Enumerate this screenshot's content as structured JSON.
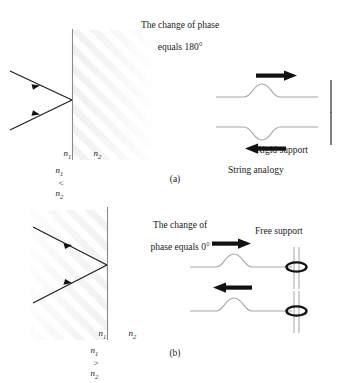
{
  "figure": {
    "panels": [
      {
        "id": "a",
        "letter": "(a)",
        "title_line1": "The change of phase",
        "title_line2": "equals 180°",
        "medium_left": "n",
        "medium_left_sub": "1",
        "medium_right": "n",
        "medium_right_sub": "2",
        "relation_left": "n",
        "relation_left_sub": "1",
        "relation_op": "<",
        "relation_right": "n",
        "relation_right_sub": "2",
        "support_label": "Rigid support",
        "analogy_label": "String analogy",
        "incident_arrow_direction": "right",
        "reflected_arrow_direction": "left",
        "pulse_incident": "up",
        "pulse_reflected": "down",
        "shading_side": "right"
      },
      {
        "id": "b",
        "letter": "(b)",
        "title_line1": "The change of",
        "title_line2": "phase equals 0°",
        "medium_left": "n",
        "medium_left_sub": "1",
        "medium_right": "n",
        "medium_right_sub": "2",
        "relation_left": "n",
        "relation_left_sub": "1",
        "relation_op": ">",
        "relation_right": "n",
        "relation_right_sub": "2",
        "support_label": "Free support",
        "incident_arrow_direction": "right",
        "reflected_arrow_direction": "left",
        "pulse_incident": "up",
        "pulse_reflected": "up",
        "shading_side": "left"
      }
    ],
    "colors": {
      "ink": "#1a1a1a",
      "string": "#a8a8a8",
      "interface": "#8a8a8a",
      "arrow": "#111111",
      "shade": "#efefef",
      "background": "#ffffff"
    }
  }
}
